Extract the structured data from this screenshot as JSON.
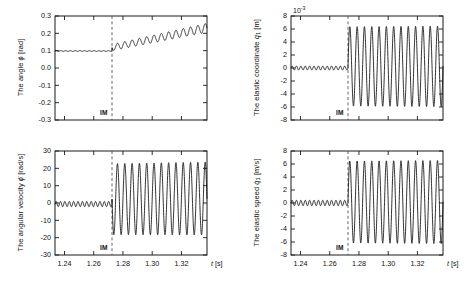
{
  "figure": {
    "background": "#ffffff",
    "line_color": "#111111",
    "axis_color": "#1a1a1a",
    "marker_color": "#555555",
    "event_label": "IM"
  },
  "chart_data": [
    {
      "id": "angle",
      "type": "line",
      "title": "",
      "ylabel": "The angle ϕ [rad]",
      "ylabel_parts": {
        "prefix": "The angle ",
        "symbol": "ϕ",
        "sub": "",
        "unit": " [rad]"
      },
      "xlabel": "",
      "xlim": [
        1.2335,
        1.3375
      ],
      "ylim": [
        -0.3,
        0.3
      ],
      "yticks": [
        -0.3,
        -0.2,
        -0.1,
        0.0,
        0.1,
        0.2,
        0.3
      ],
      "ytick_labels": [
        "-0.3",
        "-0.2",
        "-0.1",
        "0.0",
        "0.1",
        "0.2",
        "0.3"
      ],
      "xticks": [
        1.24,
        1.26,
        1.28,
        1.3,
        1.32
      ],
      "xtick_labels": [
        "1.24",
        "1.26",
        "1.28",
        "1.30",
        "1.32"
      ],
      "xtick_labels_visible": false,
      "exponent": "",
      "grid": false,
      "legend": false,
      "event_time": 1.2725,
      "event_label": "IM",
      "series": [
        {
          "name": "phi",
          "pre_event": {
            "mean": 0.098,
            "ripple_amp": 0.0022,
            "ripple_cycles": 12
          },
          "post_event": {
            "mean_start": 0.118,
            "mean_end": 0.232,
            "amp_start": 0.018,
            "amp_end": 0.026,
            "cycles": 13,
            "phase": 3.14159
          }
        }
      ]
    },
    {
      "id": "elastic-coordinate",
      "type": "line",
      "title": "",
      "ylabel": "The elastic coordinate q1 [m]",
      "ylabel_parts": {
        "prefix": "The elastic coordinate ",
        "symbol": "q",
        "sub": "1",
        "unit": " [m]"
      },
      "xlabel": "",
      "xlim": [
        1.2335,
        1.3375
      ],
      "ylim": [
        -8,
        8
      ],
      "yticks": [
        -8,
        -6,
        -4,
        -2,
        0,
        2,
        4,
        6,
        8
      ],
      "ytick_labels": [
        "-8",
        "-6",
        "-4",
        "-2",
        "0",
        "2",
        "4",
        "6",
        "8"
      ],
      "xticks": [
        1.24,
        1.26,
        1.28,
        1.3,
        1.32
      ],
      "xtick_labels": [
        "1.24",
        "1.26",
        "1.28",
        "1.30",
        "1.32"
      ],
      "xtick_labels_visible": false,
      "exponent": "10",
      "exponent_power": "-3",
      "grid": false,
      "legend": false,
      "event_time": 1.2725,
      "event_label": "IM",
      "series": [
        {
          "name": "q1",
          "pre_event": {
            "mean": 0.0,
            "ripple_amp": 0.3,
            "ripple_cycles": 13
          },
          "post_event": {
            "mean_start": 0.25,
            "mean_end": 0.25,
            "amp_start": 6.1,
            "amp_end": 6.2,
            "cycles": 13,
            "phase": 0.0
          }
        }
      ]
    },
    {
      "id": "angular-velocity",
      "type": "line",
      "title": "",
      "ylabel": "The angular velocity ϕ̇ [rad/s]",
      "ylabel_parts": {
        "prefix": "The angular velocity ",
        "symbol": "ϕ̇",
        "sub": "",
        "unit": " [rad/s]"
      },
      "xlabel": "t [s]",
      "xlim": [
        1.2335,
        1.3375
      ],
      "ylim": [
        -30,
        30
      ],
      "yticks": [
        -30,
        -20,
        -10,
        0,
        10,
        20,
        30
      ],
      "ytick_labels": [
        "-30",
        "-20",
        "-10",
        "0",
        "10",
        "20",
        "30"
      ],
      "xticks": [
        1.24,
        1.26,
        1.28,
        1.3,
        1.32
      ],
      "xtick_labels": [
        "1.24",
        "1.26",
        "1.28",
        "1.30",
        "1.32"
      ],
      "xtick_labels_visible": true,
      "exponent": "",
      "grid": false,
      "legend": false,
      "event_time": 1.2725,
      "event_label": "IM",
      "series": [
        {
          "name": "phidot",
          "pre_event": {
            "mean": -0.6,
            "ripple_amp": 1.5,
            "ripple_cycles": 13
          },
          "post_event": {
            "mean_start": 2.2,
            "mean_end": 2.6,
            "amp_start": 20.5,
            "amp_end": 21.0,
            "cycles": 13,
            "phase": 3.14159
          }
        }
      ]
    },
    {
      "id": "elastic-speed",
      "type": "line",
      "title": "",
      "ylabel": "The elastic speed q̇1 [m/s]",
      "ylabel_parts": {
        "prefix": "The elastic speed ",
        "symbol": "q̇",
        "sub": "1",
        "unit": " [m/s]"
      },
      "xlabel": "t [s]",
      "xlim": [
        1.2335,
        1.3375
      ],
      "ylim": [
        -8,
        8
      ],
      "yticks": [
        -8,
        -6,
        -4,
        -2,
        0,
        2,
        4,
        6,
        8
      ],
      "ytick_labels": [
        "-8",
        "-6",
        "-4",
        "-2",
        "0",
        "2",
        "4",
        "6",
        "8"
      ],
      "xticks": [
        1.24,
        1.26,
        1.28,
        1.3,
        1.32
      ],
      "xtick_labels": [
        "1.24",
        "1.26",
        "1.28",
        "1.30",
        "1.32"
      ],
      "xtick_labels_visible": true,
      "exponent": "",
      "grid": false,
      "legend": false,
      "event_time": 1.2725,
      "event_label": "IM",
      "series": [
        {
          "name": "q1dot",
          "pre_event": {
            "mean": 0.0,
            "ripple_amp": 0.42,
            "ripple_cycles": 13
          },
          "post_event": {
            "mean_start": 0.15,
            "mean_end": 0.15,
            "amp_start": 6.3,
            "amp_end": 6.4,
            "cycles": 13,
            "phase": 0.0
          }
        }
      ]
    }
  ],
  "axis_name_x": {
    "symbol": "t",
    "unit": " [s]"
  }
}
